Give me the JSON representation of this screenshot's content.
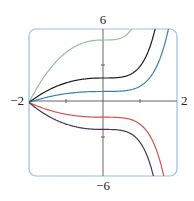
{
  "chart_data": {
    "type": "line",
    "title": "",
    "xlabel": "",
    "ylabel": "",
    "xlim": [
      -2,
      2
    ],
    "ylim": [
      -6,
      6
    ],
    "x_tick_labels": [
      "-2",
      "2"
    ],
    "y_tick_labels": [
      "6",
      "-6"
    ],
    "x_ticks": [
      -1,
      1
    ],
    "y_ticks": [
      -3,
      3
    ],
    "grid": false,
    "legend": null,
    "series": [
      {
        "name": "curve-green",
        "color": "#8fc2a4",
        "y_at_0": 5.1,
        "y_at_neg1": 4.0,
        "exits_top_at_x": 0.8
      },
      {
        "name": "curve-black",
        "color": "#1c1c1c",
        "y_at_0": 2.0,
        "y_at_neg1": 1.6,
        "exits_top_at_x": 1.45
      },
      {
        "name": "curve-blue",
        "color": "#3a7fb5",
        "y_at_0": 0.9,
        "y_at_neg1": 0.7,
        "exits_top_at_x": 1.7
      },
      {
        "name": "curve-red",
        "color": "#d2544a",
        "y_at_0": -1.2,
        "y_at_neg1": -0.9,
        "exits_bottom_at_x": 1.7
      },
      {
        "name": "curve-purple",
        "color": "#4a3552",
        "y_at_0": -2.2,
        "y_at_neg1": -1.8,
        "exits_bottom_at_x": 1.45
      }
    ]
  },
  "labels": {
    "y_top": "6",
    "y_bottom": "−6",
    "x_left": "−2",
    "x_right": "2"
  },
  "colors": {
    "frame": "#9cc0de",
    "axis": "#555555"
  }
}
